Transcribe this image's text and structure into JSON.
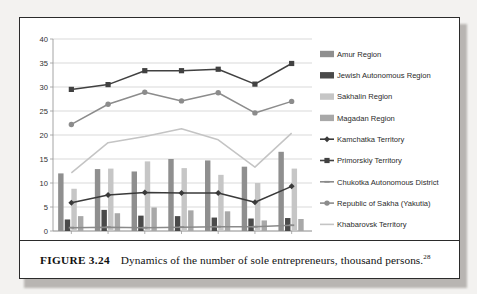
{
  "figure": {
    "label": "FIGURE 3.24",
    "caption": "Dynamics of the number of sole entrepreneurs, thousand persons.",
    "footnote_marker": "28"
  },
  "chart_data": {
    "type": "bar",
    "title": "",
    "xlabel": "",
    "ylabel": "",
    "categories": [
      "2010",
      "2011",
      "2012",
      "2013",
      "2014",
      "2015",
      "2016"
    ],
    "ylim": [
      0,
      40
    ],
    "yticks": [
      0,
      5,
      10,
      15,
      20,
      25,
      30,
      35,
      40
    ],
    "ytick_labels": [
      "0",
      "5",
      "10",
      "15",
      "20",
      "25",
      "30",
      "35",
      "40"
    ],
    "grid": true,
    "legend_position": "right",
    "series": [
      {
        "name": "Amur Region",
        "kind": "bar",
        "color": "#8f8f8f",
        "values": [
          12.0,
          12.9,
          12.4,
          15.0,
          14.7,
          13.4,
          16.5
        ]
      },
      {
        "name": "Jewish Autonomous Region",
        "kind": "bar",
        "color": "#4a4a4a",
        "values": [
          2.4,
          4.4,
          3.2,
          3.1,
          2.8,
          2.6,
          2.7
        ]
      },
      {
        "name": "Sakhalin Region",
        "kind": "bar",
        "color": "#c6c6c6",
        "values": [
          8.8,
          13.0,
          14.5,
          13.1,
          11.7,
          10.0,
          13.0
        ]
      },
      {
        "name": "Magadan Region",
        "kind": "bar",
        "color": "#a8a8a8",
        "values": [
          3.1,
          3.7,
          4.9,
          4.3,
          4.1,
          2.2,
          2.5
        ]
      },
      {
        "name": "Kamchatka Territory",
        "kind": "line",
        "color": "#3a3a3a",
        "marker": "diamond",
        "values": [
          5.9,
          7.5,
          8.0,
          7.9,
          7.9,
          6.0,
          9.3
        ]
      },
      {
        "name": "Primorskiy Territory",
        "kind": "line",
        "color": "#414141",
        "marker": "square",
        "values": [
          29.5,
          30.5,
          33.4,
          33.4,
          33.7,
          30.6,
          34.9
        ]
      },
      {
        "name": "Chukotka Autonomous District",
        "kind": "line",
        "color": "#8a8a8a",
        "marker": "dash",
        "values": [
          0.7,
          0.8,
          0.7,
          0.8,
          0.9,
          0.9,
          1.2
        ]
      },
      {
        "name": "Republic of Sakha (Yakutia)",
        "kind": "line",
        "color": "#8c8c8c",
        "marker": "circle",
        "values": [
          22.2,
          26.4,
          28.9,
          27.1,
          28.8,
          24.6,
          27.0
        ]
      },
      {
        "name": "Khabarovsk Territory",
        "kind": "line",
        "color": "#c4c4c4",
        "marker": "none",
        "values": [
          12.1,
          18.4,
          19.7,
          21.3,
          19.0,
          13.3,
          20.4
        ]
      }
    ]
  }
}
